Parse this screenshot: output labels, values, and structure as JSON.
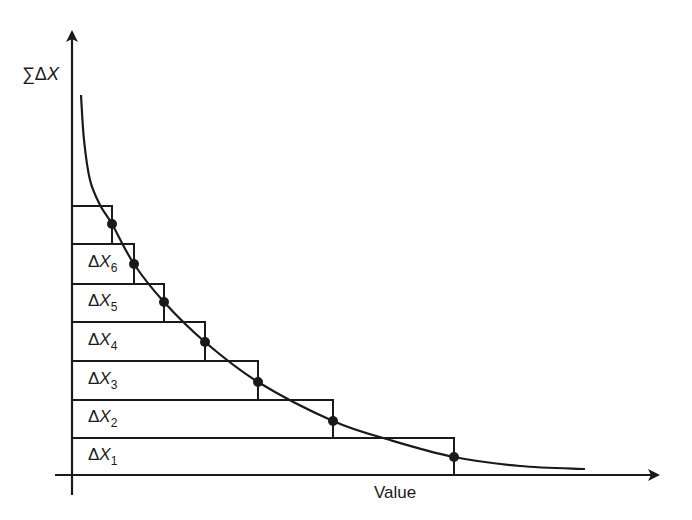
{
  "diagram": {
    "y_axis_label": {
      "sigma": "∑",
      "delta": "Δ",
      "var": "X"
    },
    "x_axis_label": "Value",
    "colors": {
      "stroke": "#1a1a1a",
      "background": "#ffffff"
    },
    "axes": {
      "origin": [
        72,
        475
      ],
      "y_axis_top": 32,
      "y_axis_bottom": 495,
      "x_axis_left": 55,
      "x_axis_right": 658
    },
    "bars": [
      {
        "label": "",
        "sub": "",
        "y_top": 206,
        "y_bottom": 244,
        "x_right": 112
      },
      {
        "label": "ΔX",
        "sub": "6",
        "y_top": 244,
        "y_bottom": 284,
        "x_right": 134
      },
      {
        "label": "ΔX",
        "sub": "5",
        "y_top": 284,
        "y_bottom": 322,
        "x_right": 164
      },
      {
        "label": "ΔX",
        "sub": "4",
        "y_top": 322,
        "y_bottom": 361,
        "x_right": 205
      },
      {
        "label": "ΔX",
        "sub": "3",
        "y_top": 361,
        "y_bottom": 400,
        "x_right": 258
      },
      {
        "label": "ΔX",
        "sub": "2",
        "y_top": 400,
        "y_bottom": 438,
        "x_right": 333
      },
      {
        "label": "ΔX",
        "sub": "1",
        "y_top": 438,
        "y_bottom": 475,
        "x_right": 454
      }
    ],
    "curve_points": [
      [
        81,
        95
      ],
      [
        84,
        140
      ],
      [
        90,
        180
      ],
      [
        100,
        205
      ],
      [
        112,
        224
      ],
      [
        134,
        264
      ],
      [
        164,
        302
      ],
      [
        205,
        342
      ],
      [
        258,
        382
      ],
      [
        333,
        421
      ],
      [
        390,
        440
      ],
      [
        454,
        457
      ],
      [
        520,
        466
      ],
      [
        585,
        469
      ]
    ],
    "dots": [
      [
        112,
        224
      ],
      [
        134,
        264
      ],
      [
        164,
        302
      ],
      [
        205,
        342
      ],
      [
        258,
        382
      ],
      [
        333,
        421
      ],
      [
        454,
        457
      ]
    ]
  }
}
